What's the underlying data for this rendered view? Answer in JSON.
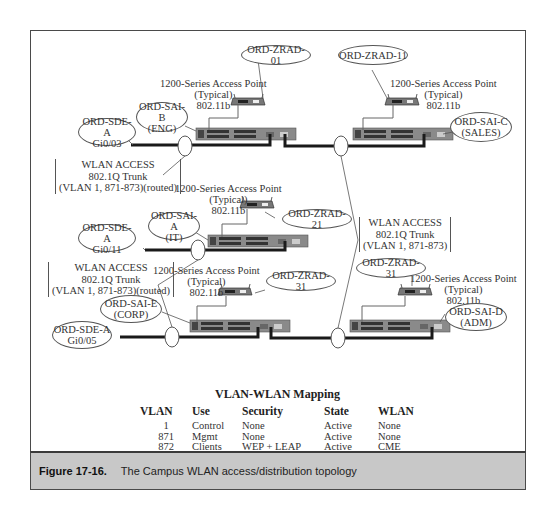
{
  "figure": {
    "number": "Figure 17-16.",
    "caption": "The Campus WLAN access/distribution topology"
  },
  "access_point_label": {
    "line1": "1200-Series Access Point",
    "line2": "(Typical)",
    "line3": "802.11b"
  },
  "nodes": {
    "zrad_01": "ORD-ZRAD-01",
    "zrad_11": "ORD-ZRAD-11",
    "zrad_21": "ORD-ZRAD-21",
    "zrad_31_left": "ORD-ZRAD-31",
    "zrad_31_right": "ORD-ZRAD-31",
    "sai_b": {
      "name": "ORD-SAI-B",
      "dept": "(ENG)"
    },
    "sai_c": {
      "name": "ORD-SAI-C",
      "dept": "(SALES)"
    },
    "sai_a": {
      "name": "ORD-SAI-A",
      "dept": "(IT)"
    },
    "sai_e": {
      "name": "ORD-SAI-E",
      "dept": "(CORP)"
    },
    "sai_d": {
      "name": "ORD-SAI-D",
      "dept": "(ADM)"
    },
    "sde_03": {
      "name": "ORD-SDE-A",
      "port": "Gi0/03"
    },
    "sde_11": {
      "name": "ORD-SDE-A",
      "port": "Gi0/11"
    },
    "sde_05": {
      "name": "ORD-SDE-A",
      "port": "Gi0/05"
    }
  },
  "trunk_labels": {
    "routed": {
      "line1": "WLAN ACCESS",
      "line2": "802.1Q Trunk",
      "line3": "(VLAN 1, 871-873)(routed)"
    },
    "plain": {
      "line1": "WLAN ACCESS",
      "line2": "802.1Q Trunk",
      "line3": "(VLAN 1, 871-873)"
    }
  },
  "mapping_table": {
    "title": "VLAN-WLAN Mapping",
    "headers": [
      "VLAN",
      "Use",
      "Security",
      "State",
      "WLAN"
    ],
    "rows": [
      [
        "1",
        "Control",
        "None",
        "Active",
        "None"
      ],
      [
        "871",
        "Mgmt",
        "None",
        "Active",
        "None"
      ],
      [
        "872",
        "Clients",
        "WEP + LEAP",
        "Active",
        "CME"
      ],
      [
        "873",
        "Public",
        "None",
        "Blocked",
        "Tsunami"
      ]
    ]
  },
  "colors": {
    "frame": "#4a4a4a",
    "caption_bg": "#c8c8c8",
    "switch_body": "#8a8a8a",
    "trunk_line": "#1a1a1a"
  }
}
